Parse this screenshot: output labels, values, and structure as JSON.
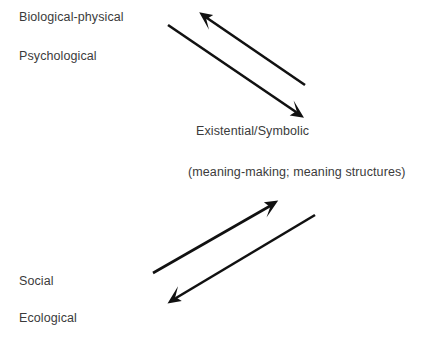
{
  "diagram": {
    "background_color": "#ffffff",
    "text_color": "#3b3b3b",
    "arrow_color": "#111111",
    "labels": [
      {
        "id": "biological-physical",
        "text": "Biological-physical",
        "x": 19,
        "y": 10
      },
      {
        "id": "psychological",
        "text": "Psychological",
        "x": 19,
        "y": 49
      },
      {
        "id": "existential-symbolic",
        "text": "Existential/Symbolic",
        "x": 196,
        "y": 124
      },
      {
        "id": "meaning-parenthetical",
        "text": "(meaning-making; meaning structures)",
        "x": 188,
        "y": 165
      },
      {
        "id": "social",
        "text": "Social",
        "x": 19,
        "y": 274
      },
      {
        "id": "ecological",
        "text": "Ecological",
        "x": 19,
        "y": 311
      }
    ],
    "arrows": [
      {
        "id": "upper-arrow-to-upper-left",
        "direction": "up-left",
        "from": {
          "x": 305,
          "y": 85
        },
        "to": {
          "x": 200,
          "y": 13
        },
        "points_toward": "Biological-physical / Psychological"
      },
      {
        "id": "upper-arrow-to-lower-right",
        "direction": "down-right",
        "from": {
          "x": 168,
          "y": 25
        },
        "to": {
          "x": 303,
          "y": 117
        },
        "points_toward": "Existential/Symbolic"
      },
      {
        "id": "lower-arrow-to-upper-right",
        "direction": "up-right",
        "from": {
          "x": 153,
          "y": 273
        },
        "to": {
          "x": 277,
          "y": 201
        },
        "points_toward": "Existential/Symbolic"
      },
      {
        "id": "lower-arrow-to-lower-left",
        "direction": "down-left",
        "from": {
          "x": 315,
          "y": 215
        },
        "to": {
          "x": 168,
          "y": 303
        },
        "points_toward": "Social / Ecological"
      }
    ]
  }
}
